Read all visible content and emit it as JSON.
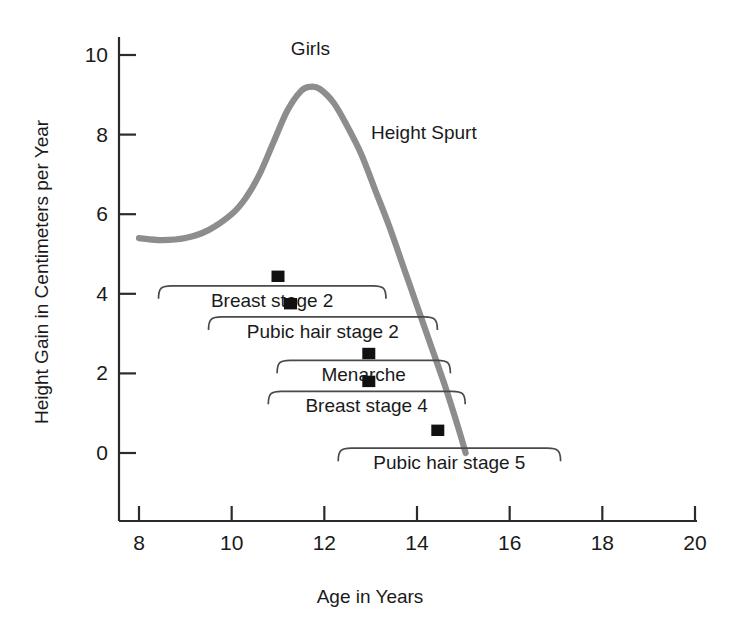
{
  "chart_data": {
    "type": "line",
    "title": "Girls",
    "xlabel": "Age in Years",
    "ylabel": "Height Gain in Centimeters per Year",
    "xlim": [
      8,
      20
    ],
    "ylim": [
      0,
      10
    ],
    "grid": false,
    "legend": "none",
    "xticks": [
      8,
      10,
      12,
      14,
      16,
      18,
      20
    ],
    "xtick_labels": [
      "8",
      "10",
      "12",
      "14",
      "16",
      "18",
      "20"
    ],
    "yticks": [
      0,
      2,
      4,
      6,
      8,
      10
    ],
    "ytick_labels": [
      "0",
      "2",
      "4",
      "6",
      "8",
      "10"
    ],
    "series": [
      {
        "name": "Height Spurt",
        "color": "#8d8d8d",
        "x": [
          8.0,
          8.5,
          9.0,
          9.5,
          10.0,
          10.3,
          10.6,
          10.9,
          11.2,
          11.5,
          11.7,
          11.9,
          12.2,
          12.5,
          12.8,
          13.1,
          13.4,
          13.7,
          14.0,
          14.3,
          14.6,
          14.9,
          15.05
        ],
        "y": [
          5.4,
          5.35,
          5.4,
          5.6,
          6.0,
          6.4,
          7.0,
          7.8,
          8.6,
          9.1,
          9.2,
          9.15,
          8.8,
          8.2,
          7.5,
          6.6,
          5.7,
          4.7,
          3.7,
          2.7,
          1.7,
          0.6,
          0.0
        ]
      }
    ],
    "annotations": [
      {
        "text": "Girls",
        "x": 11.7,
        "y": 10.0,
        "name": "girls-title"
      },
      {
        "text": "Height Spurt",
        "x": 14.15,
        "y": 7.9,
        "name": "height-spurt-label"
      }
    ],
    "event_brackets": [
      {
        "label": "Breast stage 2",
        "x_start": 8.42,
        "x_end": 13.33,
        "y": 4.2,
        "marker_x": 11.0,
        "marker_y": 4.42
      },
      {
        "label": "Pubic hair stage 2",
        "x_start": 9.5,
        "x_end": 14.44,
        "y": 3.42,
        "marker_x": 11.27,
        "marker_y": 3.73
      },
      {
        "label": "Menarche",
        "x_start": 10.98,
        "x_end": 14.72,
        "y": 2.33,
        "marker_x": 12.96,
        "marker_y": 2.48
      },
      {
        "label": "Breast stage 4",
        "x_start": 10.79,
        "x_end": 15.04,
        "y": 1.55,
        "marker_x": 12.96,
        "marker_y": 1.78
      },
      {
        "label": "Pubic hair stage 5",
        "x_start": 12.3,
        "x_end": 17.1,
        "y": 0.12,
        "marker_x": 14.45,
        "marker_y": 0.55
      }
    ],
    "colors": {
      "curve": "#8d8d8d",
      "axis": "#2b2b2b",
      "bracket": "#4a4a4a",
      "marker": "#111111",
      "background": "#ffffff",
      "text": "#1a1a1a"
    }
  }
}
